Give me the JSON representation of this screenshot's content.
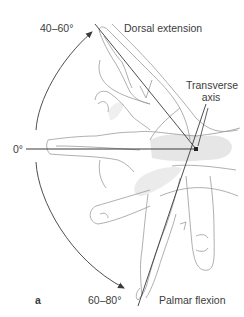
{
  "figure": {
    "panel_label": "a",
    "labels": {
      "extension_angle": "40–60°",
      "extension_title": "Dorsal extension",
      "neutral_angle": "0°",
      "axis_line1": "Transverse",
      "axis_line2": "axis",
      "flexion_angle": "60–80°",
      "flexion_title": "Palmar flexion"
    },
    "pivot": {
      "x": 196,
      "y": 149
    },
    "colors": {
      "line": "#3a3a3a",
      "sketch": "#9a9a9a",
      "shade": "#cfcfcf",
      "text": "#3c3c3c"
    }
  }
}
